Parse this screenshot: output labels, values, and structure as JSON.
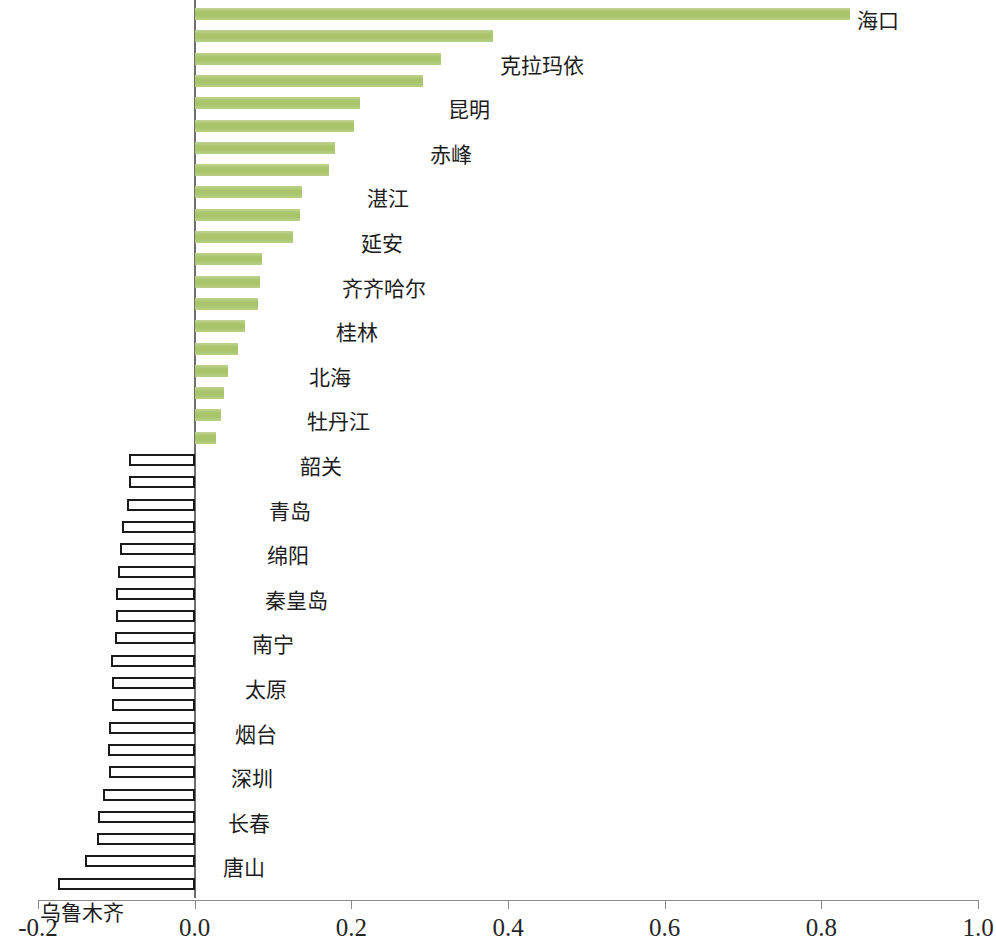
{
  "chart_data": {
    "type": "bar",
    "orientation": "horizontal",
    "title": "",
    "subtitle": "",
    "xlabel": "",
    "ylabel": "",
    "xlim": [
      -0.2,
      1.0
    ],
    "grid": false,
    "legend": null,
    "legend_position": "none",
    "axis": {
      "tick_labels": [
        "-0.2",
        "0.0",
        "0.2",
        "0.4",
        "0.6",
        "0.8",
        "1.0"
      ],
      "tick_values": [
        -0.2,
        0.0,
        0.2,
        0.4,
        0.6,
        0.8,
        1.0
      ]
    },
    "colors": {
      "positive_bar_fill": "#a9c56b",
      "negative_bar_fill": "#ffffff",
      "negative_bar_stroke": "#1a1a1a",
      "axis": "#8a8a8a",
      "text": "#1d1d1d"
    },
    "categories": [
      "海口",
      "克拉玛依",
      "昆明",
      "赤峰",
      "湛江",
      "延安",
      "齐齐哈尔",
      "桂林",
      "北海",
      "牡丹江",
      "韶关",
      "青岛",
      "绵阳",
      "秦皇岛",
      "南宁",
      "太原",
      "烟台",
      "深圳",
      "长春",
      "唐山",
      "乌鲁木齐",
      "芜湖",
      "安阳",
      "武汉",
      "荆州",
      "泰安",
      "日照",
      "鞍山",
      "银川",
      "西安",
      "天津",
      "平顶山",
      "西宁",
      "长治",
      "济宁",
      "潍坊",
      "南京",
      "包头",
      "马鞍山",
      "淄博"
    ],
    "values": [
      0.836,
      0.381,
      0.315,
      0.291,
      0.211,
      0.204,
      0.179,
      0.172,
      0.137,
      0.134,
      0.125,
      0.086,
      0.083,
      0.081,
      0.064,
      0.055,
      0.042,
      0.038,
      0.034,
      0.027,
      -0.084,
      -0.084,
      -0.087,
      -0.093,
      -0.095,
      -0.098,
      -0.101,
      -0.101,
      -0.102,
      -0.107,
      -0.105,
      -0.106,
      -0.11,
      -0.111,
      -0.109,
      -0.117,
      -0.124,
      -0.125,
      -0.14,
      -0.174
    ]
  }
}
